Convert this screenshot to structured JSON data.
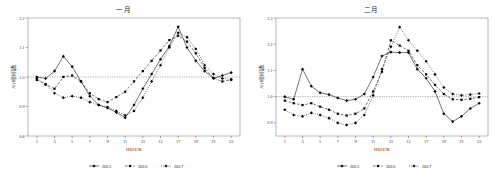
{
  "panels": [
    {
      "title": "一月",
      "ylabel": "AQI相对指数",
      "xlabel": "HOUR"
    },
    {
      "title": "二月",
      "ylabel": "AQI相对指数",
      "xlabel": "HOUR"
    }
  ],
  "legend": [
    {
      "label": "2015",
      "style": "solid"
    },
    {
      "label": "2016",
      "style": "dashed"
    },
    {
      "label": "2017",
      "style": "dotted"
    }
  ],
  "chart_data": [
    {
      "type": "line",
      "title": "一月",
      "xlabel": "HOUR",
      "ylabel": "AQI相对指数",
      "xlim": [
        0,
        24
      ],
      "ylim": [
        0.8,
        1.2
      ],
      "xticks": [
        1,
        3,
        5,
        7,
        9,
        11,
        13,
        15,
        17,
        19,
        21,
        23
      ],
      "yticks": [
        0.8,
        0.9,
        1.0,
        1.1,
        1.2
      ],
      "grid": false,
      "reference_line": 1.0,
      "legend_position": "bottom",
      "x": [
        1,
        2,
        3,
        4,
        5,
        6,
        7,
        8,
        9,
        10,
        11,
        12,
        13,
        14,
        15,
        16,
        17,
        18,
        19,
        20,
        21,
        22,
        23
      ],
      "series": [
        {
          "name": "2015",
          "marker": "diamond",
          "linestyle": "solid",
          "values": [
            1.0,
            0.995,
            1.02,
            1.07,
            1.035,
            0.985,
            0.935,
            0.905,
            0.895,
            0.88,
            0.862,
            0.905,
            0.96,
            1.01,
            1.06,
            1.105,
            1.17,
            1.1,
            1.055,
            1.02,
            0.995,
            1.005,
            1.015
          ]
        },
        {
          "name": "2016",
          "marker": "square",
          "linestyle": "dashed",
          "values": [
            0.99,
            0.975,
            0.96,
            1.0,
            1.005,
            0.985,
            0.945,
            0.925,
            0.915,
            0.932,
            0.95,
            0.985,
            1.02,
            1.055,
            1.09,
            1.125,
            1.14,
            1.12,
            1.08,
            1.03,
            0.997,
            0.985,
            0.99
          ]
        },
        {
          "name": "2017",
          "marker": "diamond",
          "linestyle": "dotted",
          "values": [
            0.995,
            0.975,
            0.945,
            0.93,
            0.935,
            0.93,
            0.915,
            0.905,
            0.898,
            0.885,
            0.87,
            0.885,
            0.93,
            0.985,
            1.04,
            1.1,
            1.15,
            1.135,
            1.095,
            1.04,
            1.01,
            0.995,
            0.992
          ]
        }
      ]
    },
    {
      "type": "line",
      "title": "二月",
      "xlabel": "HOUR",
      "ylabel": "AQI相对指数",
      "xlim": [
        0,
        24
      ],
      "ylim": [
        0.85,
        1.3
      ],
      "xticks": [
        1,
        3,
        5,
        7,
        9,
        11,
        13,
        15,
        17,
        19,
        21,
        23
      ],
      "yticks": [
        0.9,
        1.0,
        1.1,
        1.2,
        1.3
      ],
      "grid": false,
      "reference_line": 1.0,
      "legend_position": "bottom",
      "x": [
        1,
        2,
        3,
        4,
        5,
        6,
        7,
        8,
        9,
        10,
        11,
        12,
        13,
        14,
        15,
        16,
        17,
        18,
        19,
        20,
        21,
        22,
        23
      ],
      "series": [
        {
          "name": "2015",
          "marker": "diamond",
          "linestyle": "solid",
          "values": [
            1.0,
            0.99,
            1.105,
            1.04,
            1.015,
            1.008,
            0.995,
            0.985,
            0.99,
            1.01,
            1.075,
            1.155,
            1.17,
            1.168,
            1.168,
            1.105,
            1.07,
            1.02,
            0.935,
            0.905,
            0.925,
            0.955,
            0.975
          ]
        },
        {
          "name": "2016",
          "marker": "square",
          "linestyle": "dashed",
          "values": [
            0.985,
            0.975,
            0.968,
            0.975,
            0.962,
            0.95,
            0.935,
            0.928,
            0.935,
            0.955,
            1.02,
            1.095,
            1.215,
            1.195,
            1.175,
            1.12,
            1.085,
            1.045,
            1.01,
            0.99,
            0.988,
            0.992,
            0.998
          ]
        },
        {
          "name": "2017",
          "marker": "diamond",
          "linestyle": "dotted",
          "values": [
            0.95,
            0.93,
            0.925,
            0.938,
            0.93,
            0.918,
            0.9,
            0.892,
            0.9,
            0.93,
            1.005,
            1.105,
            1.19,
            1.265,
            1.215,
            1.175,
            1.135,
            1.085,
            1.035,
            1.01,
            1.005,
            1.008,
            1.012
          ]
        }
      ]
    }
  ]
}
